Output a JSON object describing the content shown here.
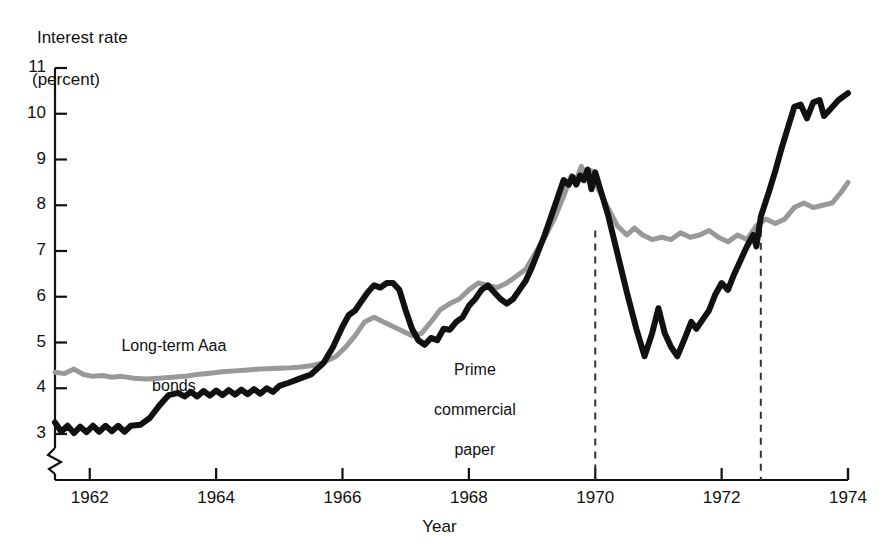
{
  "chart_data": {
    "type": "line",
    "title": "",
    "ylabel": "Interest rate (percent)",
    "ylabel_line1": "Interest rate",
    "ylabel_line2": "(percent)",
    "xlabel": "Year",
    "xlim": [
      1961.4,
      1974.0
    ],
    "ylim": [
      2.55,
      11.0
    ],
    "y_axis_break": true,
    "grid": false,
    "legend_position": "inline-annotations",
    "yticks": [
      3,
      4,
      5,
      6,
      7,
      8,
      9,
      10,
      11
    ],
    "ytick_labels": [
      "3",
      "4",
      "5",
      "6",
      "7",
      "8",
      "9",
      "10",
      "11"
    ],
    "xticks": [
      1962,
      1964,
      1966,
      1968,
      1970,
      1972,
      1974
    ],
    "xtick_labels": [
      "1962",
      "1964",
      "1966",
      "1968",
      "1970",
      "1972",
      "1974"
    ],
    "annotations": [
      {
        "name": "vline-1970",
        "type": "vertical-dashed-line",
        "x": 1970.0,
        "y_top": 7.45,
        "y_bottom": 2.55
      },
      {
        "name": "vline-1972-6",
        "type": "vertical-dashed-line",
        "x": 1972.62,
        "y_top": 7.75,
        "y_bottom": 2.55
      }
    ],
    "series": [
      {
        "name": "Long-term Aaa bonds",
        "label_line1": "Long-term Aaa",
        "label_line2": "bonds",
        "color": "#999999",
        "width": 5,
        "points": [
          [
            1961.45,
            4.35
          ],
          [
            1961.6,
            4.32
          ],
          [
            1961.75,
            4.42
          ],
          [
            1961.9,
            4.3
          ],
          [
            1962.05,
            4.26
          ],
          [
            1962.2,
            4.28
          ],
          [
            1962.35,
            4.24
          ],
          [
            1962.5,
            4.26
          ],
          [
            1962.7,
            4.22
          ],
          [
            1962.9,
            4.2
          ],
          [
            1963.1,
            4.22
          ],
          [
            1963.3,
            4.24
          ],
          [
            1963.5,
            4.26
          ],
          [
            1963.7,
            4.3
          ],
          [
            1963.9,
            4.33
          ],
          [
            1964.1,
            4.36
          ],
          [
            1964.3,
            4.38
          ],
          [
            1964.5,
            4.4
          ],
          [
            1964.7,
            4.42
          ],
          [
            1964.9,
            4.43
          ],
          [
            1965.1,
            4.44
          ],
          [
            1965.3,
            4.46
          ],
          [
            1965.5,
            4.49
          ],
          [
            1965.7,
            4.56
          ],
          [
            1965.9,
            4.7
          ],
          [
            1966.05,
            4.9
          ],
          [
            1966.2,
            5.15
          ],
          [
            1966.35,
            5.45
          ],
          [
            1966.5,
            5.55
          ],
          [
            1966.65,
            5.45
          ],
          [
            1966.8,
            5.35
          ],
          [
            1966.95,
            5.25
          ],
          [
            1967.1,
            5.15
          ],
          [
            1967.25,
            5.2
          ],
          [
            1967.4,
            5.45
          ],
          [
            1967.55,
            5.72
          ],
          [
            1967.7,
            5.85
          ],
          [
            1967.85,
            5.95
          ],
          [
            1968.0,
            6.15
          ],
          [
            1968.15,
            6.3
          ],
          [
            1968.3,
            6.25
          ],
          [
            1968.45,
            6.2
          ],
          [
            1968.6,
            6.3
          ],
          [
            1968.75,
            6.45
          ],
          [
            1968.9,
            6.6
          ],
          [
            1969.05,
            6.95
          ],
          [
            1969.2,
            7.3
          ],
          [
            1969.35,
            7.7
          ],
          [
            1969.5,
            8.2
          ],
          [
            1969.62,
            8.65
          ],
          [
            1969.7,
            8.55
          ],
          [
            1969.78,
            8.85
          ],
          [
            1969.86,
            8.6
          ],
          [
            1969.94,
            8.75
          ],
          [
            1970.05,
            8.35
          ],
          [
            1970.2,
            7.95
          ],
          [
            1970.35,
            7.55
          ],
          [
            1970.5,
            7.35
          ],
          [
            1970.62,
            7.5
          ],
          [
            1970.75,
            7.35
          ],
          [
            1970.9,
            7.25
          ],
          [
            1971.05,
            7.3
          ],
          [
            1971.2,
            7.25
          ],
          [
            1971.35,
            7.4
          ],
          [
            1971.5,
            7.3
          ],
          [
            1971.65,
            7.35
          ],
          [
            1971.8,
            7.45
          ],
          [
            1971.95,
            7.3
          ],
          [
            1972.1,
            7.2
          ],
          [
            1972.25,
            7.35
          ],
          [
            1972.4,
            7.25
          ],
          [
            1972.55,
            7.55
          ],
          [
            1972.7,
            7.7
          ],
          [
            1972.85,
            7.6
          ],
          [
            1973.0,
            7.7
          ],
          [
            1973.15,
            7.95
          ],
          [
            1973.3,
            8.05
          ],
          [
            1973.45,
            7.95
          ],
          [
            1973.6,
            8.0
          ],
          [
            1973.75,
            8.05
          ],
          [
            1973.9,
            8.3
          ],
          [
            1974.0,
            8.5
          ]
        ]
      },
      {
        "name": "Prime commercial paper",
        "label_line1": "Prime",
        "label_line2": "commercial",
        "label_line3": "paper",
        "color": "#111111",
        "width": 6,
        "points": [
          [
            1961.45,
            3.25
          ],
          [
            1961.55,
            3.05
          ],
          [
            1961.65,
            3.18
          ],
          [
            1961.75,
            3.02
          ],
          [
            1961.85,
            3.16
          ],
          [
            1961.95,
            3.04
          ],
          [
            1962.05,
            3.18
          ],
          [
            1962.15,
            3.05
          ],
          [
            1962.25,
            3.18
          ],
          [
            1962.35,
            3.06
          ],
          [
            1962.45,
            3.18
          ],
          [
            1962.55,
            3.05
          ],
          [
            1962.65,
            3.18
          ],
          [
            1962.8,
            3.2
          ],
          [
            1962.95,
            3.35
          ],
          [
            1963.1,
            3.62
          ],
          [
            1963.25,
            3.85
          ],
          [
            1963.4,
            3.9
          ],
          [
            1963.5,
            3.82
          ],
          [
            1963.6,
            3.92
          ],
          [
            1963.7,
            3.82
          ],
          [
            1963.8,
            3.94
          ],
          [
            1963.9,
            3.84
          ],
          [
            1964.0,
            3.95
          ],
          [
            1964.1,
            3.85
          ],
          [
            1964.2,
            3.96
          ],
          [
            1964.3,
            3.86
          ],
          [
            1964.4,
            3.97
          ],
          [
            1964.5,
            3.87
          ],
          [
            1964.6,
            3.98
          ],
          [
            1964.7,
            3.88
          ],
          [
            1964.8,
            4.0
          ],
          [
            1964.9,
            3.92
          ],
          [
            1965.0,
            4.05
          ],
          [
            1965.15,
            4.12
          ],
          [
            1965.3,
            4.2
          ],
          [
            1965.5,
            4.3
          ],
          [
            1965.7,
            4.55
          ],
          [
            1965.85,
            4.9
          ],
          [
            1966.0,
            5.35
          ],
          [
            1966.1,
            5.6
          ],
          [
            1966.2,
            5.7
          ],
          [
            1966.3,
            5.9
          ],
          [
            1966.4,
            6.1
          ],
          [
            1966.5,
            6.25
          ],
          [
            1966.6,
            6.2
          ],
          [
            1966.7,
            6.3
          ],
          [
            1966.8,
            6.3
          ],
          [
            1966.9,
            6.15
          ],
          [
            1967.0,
            5.7
          ],
          [
            1967.1,
            5.3
          ],
          [
            1967.2,
            5.05
          ],
          [
            1967.3,
            4.95
          ],
          [
            1967.4,
            5.1
          ],
          [
            1967.5,
            5.05
          ],
          [
            1967.6,
            5.3
          ],
          [
            1967.7,
            5.28
          ],
          [
            1967.8,
            5.45
          ],
          [
            1967.9,
            5.55
          ],
          [
            1968.0,
            5.8
          ],
          [
            1968.1,
            5.95
          ],
          [
            1968.2,
            6.15
          ],
          [
            1968.3,
            6.25
          ],
          [
            1968.4,
            6.1
          ],
          [
            1968.5,
            5.95
          ],
          [
            1968.6,
            5.85
          ],
          [
            1968.7,
            5.95
          ],
          [
            1968.8,
            6.15
          ],
          [
            1968.9,
            6.35
          ],
          [
            1969.0,
            6.65
          ],
          [
            1969.1,
            7.0
          ],
          [
            1969.2,
            7.35
          ],
          [
            1969.3,
            7.75
          ],
          [
            1969.4,
            8.15
          ],
          [
            1969.5,
            8.55
          ],
          [
            1969.58,
            8.45
          ],
          [
            1969.64,
            8.62
          ],
          [
            1969.7,
            8.45
          ],
          [
            1969.76,
            8.65
          ],
          [
            1969.82,
            8.55
          ],
          [
            1969.88,
            8.78
          ],
          [
            1969.94,
            8.35
          ],
          [
            1970.0,
            8.72
          ],
          [
            1970.08,
            8.35
          ],
          [
            1970.2,
            7.8
          ],
          [
            1970.35,
            6.95
          ],
          [
            1970.5,
            6.1
          ],
          [
            1970.65,
            5.3
          ],
          [
            1970.78,
            4.7
          ],
          [
            1970.9,
            5.2
          ],
          [
            1971.0,
            5.75
          ],
          [
            1971.1,
            5.2
          ],
          [
            1971.2,
            4.9
          ],
          [
            1971.3,
            4.7
          ],
          [
            1971.42,
            5.1
          ],
          [
            1971.52,
            5.45
          ],
          [
            1971.6,
            5.3
          ],
          [
            1971.7,
            5.5
          ],
          [
            1971.8,
            5.7
          ],
          [
            1971.9,
            6.05
          ],
          [
            1972.0,
            6.3
          ],
          [
            1972.1,
            6.15
          ],
          [
            1972.2,
            6.5
          ],
          [
            1972.3,
            6.8
          ],
          [
            1972.4,
            7.1
          ],
          [
            1972.5,
            7.35
          ],
          [
            1972.55,
            7.1
          ],
          [
            1972.62,
            7.75
          ],
          [
            1972.75,
            8.3
          ],
          [
            1972.85,
            8.75
          ],
          [
            1972.95,
            9.25
          ],
          [
            1973.05,
            9.7
          ],
          [
            1973.15,
            10.15
          ],
          [
            1973.25,
            10.2
          ],
          [
            1973.35,
            9.9
          ],
          [
            1973.45,
            10.25
          ],
          [
            1973.55,
            10.3
          ],
          [
            1973.62,
            9.95
          ],
          [
            1973.72,
            10.1
          ],
          [
            1973.85,
            10.3
          ],
          [
            1974.0,
            10.45
          ]
        ]
      }
    ]
  }
}
